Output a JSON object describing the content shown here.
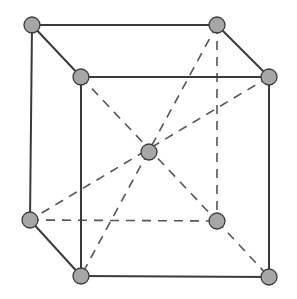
{
  "diagram": {
    "type": "body-centered cubic unit cell",
    "colors": {
      "atom_fill": "#a6a6a6",
      "atom_stroke": "#3a3a3a",
      "edge": "#3a3a3a",
      "dash": "#555555"
    },
    "atoms": [
      {
        "id": "back-top-left",
        "x": 32,
        "y": 25
      },
      {
        "id": "back-top-right",
        "x": 217,
        "y": 25
      },
      {
        "id": "front-top-left",
        "x": 81,
        "y": 77
      },
      {
        "id": "front-top-right",
        "x": 269,
        "y": 77
      },
      {
        "id": "center",
        "x": 149,
        "y": 152
      },
      {
        "id": "back-bottom-left",
        "x": 30,
        "y": 220
      },
      {
        "id": "back-bottom-right",
        "x": 217,
        "y": 221
      },
      {
        "id": "front-bottom-left",
        "x": 81,
        "y": 276
      },
      {
        "id": "front-bottom-right",
        "x": 269,
        "y": 277
      }
    ],
    "solid_edges": [
      [
        "back-top-left",
        "back-top-right"
      ],
      [
        "back-top-left",
        "front-top-left"
      ],
      [
        "back-top-right",
        "front-top-right"
      ],
      [
        "front-top-left",
        "front-top-right"
      ],
      [
        "back-top-left",
        "back-bottom-left"
      ],
      [
        "front-top-left",
        "front-bottom-left"
      ],
      [
        "front-top-right",
        "front-bottom-right"
      ],
      [
        "back-bottom-left",
        "front-bottom-left"
      ],
      [
        "front-bottom-left",
        "front-bottom-right"
      ]
    ],
    "dashed_edges": [
      [
        "back-bottom-left",
        "back-bottom-right"
      ],
      [
        "back-top-right",
        "back-bottom-right"
      ],
      [
        "back-bottom-right",
        "front-bottom-right"
      ],
      [
        "front-top-left",
        "back-bottom-right"
      ],
      [
        "front-top-right",
        "back-bottom-left"
      ],
      [
        "back-top-right",
        "front-bottom-left"
      ]
    ]
  }
}
